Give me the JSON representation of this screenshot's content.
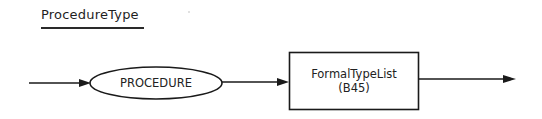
{
  "diagram": {
    "title": "ProcedureType",
    "type": "syntax-diagram",
    "nodes": [
      {
        "id": "procedure",
        "kind": "terminal",
        "shape": "ellipse",
        "label": "PROCEDURE"
      },
      {
        "id": "formal-type-list",
        "kind": "non-terminal",
        "shape": "rectangle",
        "label": "FormalTypeList",
        "reference": "(B45)"
      }
    ],
    "edges": [
      {
        "from": "entry",
        "to": "procedure"
      },
      {
        "from": "procedure",
        "to": "formal-type-list"
      },
      {
        "from": "formal-type-list",
        "to": "exit"
      }
    ],
    "colors": {
      "stroke": "#1a1a1a",
      "background": "#ffffff"
    }
  }
}
